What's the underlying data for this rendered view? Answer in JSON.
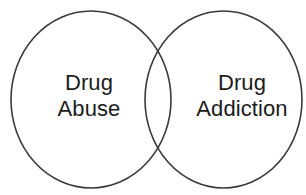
{
  "diagram": {
    "type": "venn",
    "title": "",
    "background_color": "#ffffff",
    "stroke_color": "#3a3a3a",
    "stroke_width": 1.6,
    "text_color": "#1c1c1c",
    "sets": [
      {
        "id": "left",
        "name": "drug-abuse-set",
        "label_lines": [
          "Drug",
          "Abuse"
        ],
        "label_line1": "Drug",
        "label_line2": "Abuse",
        "full_label": "Drug Abuse",
        "cx": 91,
        "cy": 99.5,
        "rx": 80,
        "ry": 88.5
      },
      {
        "id": "right",
        "name": "drug-addiction-set",
        "label_lines": [
          "Drug",
          "Addiction"
        ],
        "label_line1": "Drug",
        "label_line2": "Addiction",
        "full_label": "Drug Addiction",
        "cx": 223.5,
        "cy": 99.5,
        "rx": 78.5,
        "ry": 88.5
      }
    ],
    "intersection": {
      "name": "overlap-region",
      "label": "",
      "top_point_x": 160,
      "top_point_y": 40,
      "bottom_point_x": 160,
      "bottom_point_y": 158
    }
  }
}
